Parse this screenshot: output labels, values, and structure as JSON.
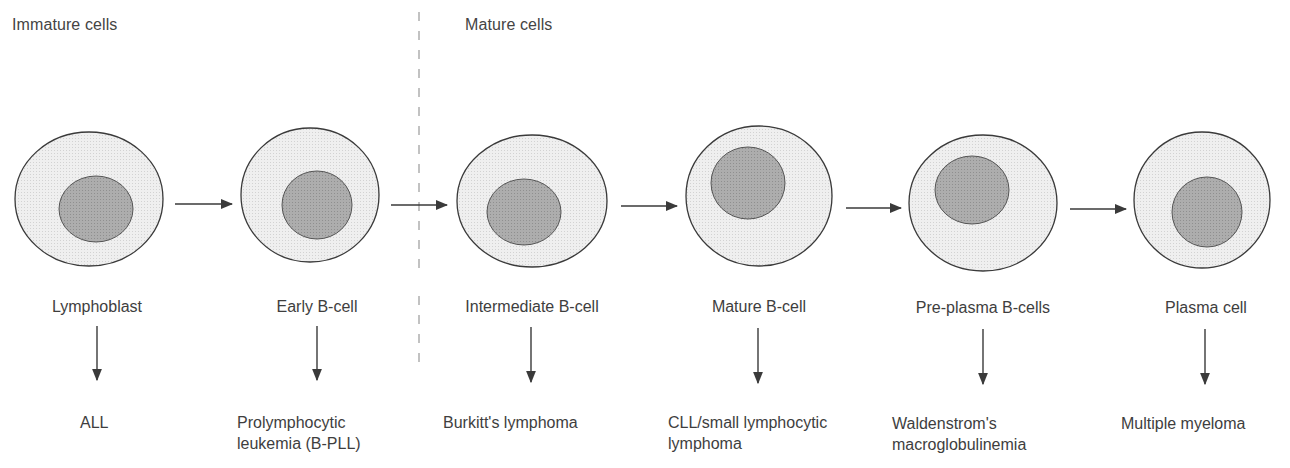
{
  "sections": {
    "immature": "Immature cells",
    "mature": "Mature cells"
  },
  "stages": [
    {
      "label": "Lymphoblast",
      "disease": "ALL"
    },
    {
      "label": "Early B-cell",
      "disease": "Prolymphocytic\nleukemia (B-PLL)"
    },
    {
      "label": "Intermediate B-cell",
      "disease": "Burkitt's lymphoma"
    },
    {
      "label": "Mature B-cell",
      "disease": "CLL/small lymphocytic\nlymphoma"
    },
    {
      "label": "Pre-plasma B-cells",
      "disease": "Waldenstrom's\nmacroglobulinemia"
    },
    {
      "label": "Plasma cell",
      "disease": "Multiple myeloma"
    }
  ],
  "colors": {
    "cytoplasm": "#ececec",
    "nucleus": "#a9a9a9",
    "outline": "#3a3a3a",
    "arrow": "#3a3a3a",
    "divider": "#9a9a9a"
  }
}
